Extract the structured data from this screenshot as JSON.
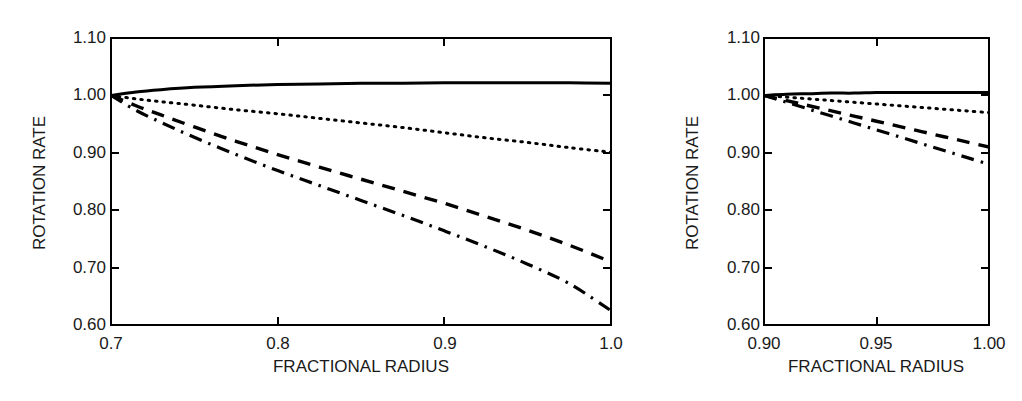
{
  "figure": {
    "background_color": "#ffffff",
    "line_color": "#000000",
    "panel_count": 2
  },
  "chart_data": [
    {
      "type": "line",
      "panel": "left",
      "title": "",
      "xlabel": "FRACTIONAL RADIUS",
      "ylabel": "ROTATION RATE",
      "xlim": [
        0.7,
        1.0
      ],
      "ylim": [
        0.6,
        1.1
      ],
      "xticks": [
        0.7,
        0.8,
        0.9,
        1.0
      ],
      "xtick_labels": [
        "0.7",
        "0.8",
        "0.9",
        "1.0"
      ],
      "yticks": [
        0.6,
        0.7,
        0.8,
        0.9,
        1.0,
        1.1
      ],
      "ytick_labels": [
        "0.60",
        "0.70",
        "0.80",
        "0.90",
        "1.00",
        "1.10"
      ],
      "grid": false,
      "legend": "none",
      "frame": "box",
      "series": [
        {
          "name": "solid",
          "style": "solid",
          "x": [
            0.7,
            0.715,
            0.73,
            0.75,
            0.775,
            0.8,
            0.825,
            0.85,
            0.875,
            0.9,
            0.925,
            0.95,
            0.975,
            1.0
          ],
          "values": [
            1.0,
            1.006,
            1.01,
            1.014,
            1.017,
            1.019,
            1.02,
            1.021,
            1.021,
            1.022,
            1.022,
            1.022,
            1.022,
            1.021
          ]
        },
        {
          "name": "dotted",
          "style": "dotted",
          "x": [
            0.7,
            0.715,
            0.73,
            0.75,
            0.775,
            0.8,
            0.825,
            0.85,
            0.875,
            0.9,
            0.925,
            0.95,
            0.975,
            1.0
          ],
          "values": [
            1.0,
            0.994,
            0.989,
            0.983,
            0.975,
            0.968,
            0.96,
            0.952,
            0.944,
            0.935,
            0.926,
            0.918,
            0.909,
            0.901
          ]
        },
        {
          "name": "dashed",
          "style": "dashed",
          "x": [
            0.7,
            0.715,
            0.73,
            0.75,
            0.775,
            0.8,
            0.825,
            0.85,
            0.875,
            0.9,
            0.925,
            0.95,
            0.975,
            1.0
          ],
          "values": [
            1.0,
            0.982,
            0.966,
            0.945,
            0.92,
            0.897,
            0.875,
            0.854,
            0.833,
            0.812,
            0.789,
            0.765,
            0.739,
            0.71
          ]
        },
        {
          "name": "dash-dot",
          "style": "dashdot",
          "x": [
            0.7,
            0.715,
            0.73,
            0.75,
            0.775,
            0.8,
            0.825,
            0.85,
            0.875,
            0.9,
            0.925,
            0.95,
            0.975,
            1.0
          ],
          "values": [
            1.0,
            0.974,
            0.953,
            0.927,
            0.897,
            0.869,
            0.843,
            0.817,
            0.791,
            0.764,
            0.736,
            0.706,
            0.672,
            0.625
          ]
        }
      ]
    },
    {
      "type": "line",
      "panel": "right",
      "title": "",
      "xlabel": "FRACTIONAL RADIUS",
      "ylabel": "ROTATION RATE",
      "xlim": [
        0.9,
        1.0
      ],
      "ylim": [
        0.6,
        1.1
      ],
      "xticks": [
        0.9,
        0.95,
        1.0
      ],
      "xtick_labels": [
        "0.90",
        "0.95",
        "1.00"
      ],
      "yticks": [
        0.6,
        0.7,
        0.8,
        0.9,
        1.0,
        1.1
      ],
      "ytick_labels": [
        "0.60",
        "0.70",
        "0.80",
        "0.90",
        "1.00",
        "1.10"
      ],
      "grid": false,
      "legend": "none",
      "frame": "box",
      "series": [
        {
          "name": "solid",
          "style": "solid",
          "x": [
            0.9,
            0.91,
            0.92,
            0.93,
            0.94,
            0.95,
            0.96,
            0.97,
            0.98,
            0.99,
            1.0
          ],
          "values": [
            1.0,
            1.002,
            1.003,
            1.004,
            1.004,
            1.005,
            1.005,
            1.005,
            1.005,
            1.005,
            1.005
          ]
        },
        {
          "name": "dotted",
          "style": "dotted",
          "x": [
            0.9,
            0.91,
            0.92,
            0.93,
            0.94,
            0.95,
            0.96,
            0.97,
            0.98,
            0.99,
            1.0
          ],
          "values": [
            1.0,
            0.997,
            0.994,
            0.991,
            0.988,
            0.985,
            0.982,
            0.979,
            0.976,
            0.973,
            0.97
          ]
        },
        {
          "name": "dashed",
          "style": "dashed",
          "x": [
            0.9,
            0.91,
            0.92,
            0.93,
            0.94,
            0.95,
            0.96,
            0.97,
            0.98,
            0.99,
            1.0
          ],
          "values": [
            1.0,
            0.991,
            0.982,
            0.973,
            0.964,
            0.955,
            0.946,
            0.937,
            0.928,
            0.919,
            0.91
          ]
        },
        {
          "name": "dash-dot",
          "style": "dashdot",
          "x": [
            0.9,
            0.91,
            0.92,
            0.93,
            0.94,
            0.95,
            0.96,
            0.97,
            0.98,
            0.99,
            1.0
          ],
          "values": [
            1.0,
            0.988,
            0.976,
            0.964,
            0.952,
            0.94,
            0.928,
            0.916,
            0.904,
            0.892,
            0.88
          ]
        }
      ]
    }
  ],
  "left_panel": {
    "ylabel": "ROTATION RATE",
    "xlabel": "FRACTIONAL RADIUS",
    "ytick_labels": [
      "1.10",
      "1.00",
      "0.90",
      "0.80",
      "0.70",
      "0.60"
    ],
    "xtick_labels": [
      "0.7",
      "0.8",
      "0.9",
      "1.0"
    ]
  },
  "right_panel": {
    "ylabel": "ROTATION RATE",
    "xlabel": "FRACTIONAL RADIUS",
    "ytick_labels": [
      "1.10",
      "1.00",
      "0.90",
      "0.80",
      "0.70",
      "0.60"
    ],
    "xtick_labels": [
      "0.90",
      "0.95",
      "1.00"
    ]
  }
}
